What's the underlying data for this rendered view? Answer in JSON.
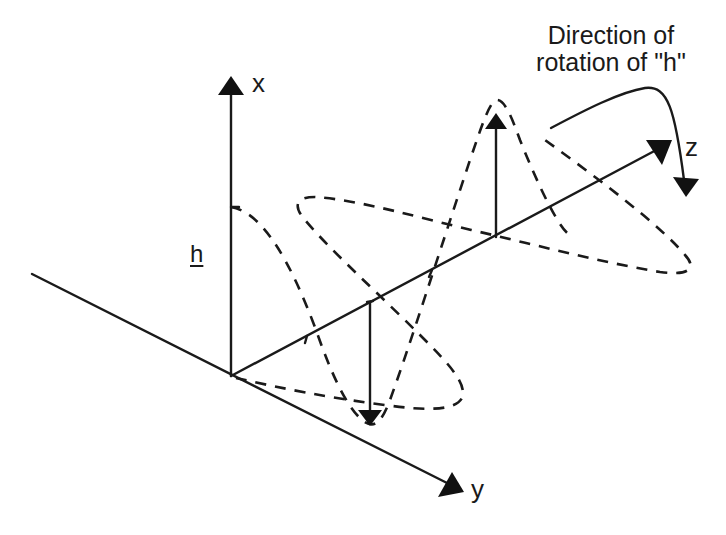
{
  "diagram": {
    "title_line1": "Direction of",
    "title_line2": "rotation of \"h\"",
    "axes": {
      "x": "x",
      "y": "y",
      "z": "z"
    },
    "vector_label": "h",
    "colors": {
      "stroke": "#1a1a1a",
      "background": "#ffffff"
    }
  }
}
